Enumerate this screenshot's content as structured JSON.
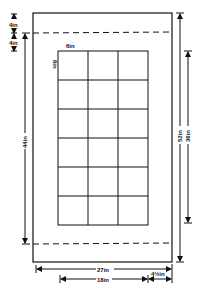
{
  "diagram": {
    "type": "dimensioned layout drawing",
    "outer_frame": {
      "width_label": "27in",
      "height_label": "52in"
    },
    "top_margin": {
      "label": "4in"
    },
    "inner_offset": {
      "label": "4in"
    },
    "dashed_zone": {
      "height_label": "44in"
    },
    "grid": {
      "columns": 3,
      "rows": 6,
      "cell_label_horizontal": "6in",
      "cell_label_vertical": "6in",
      "width_label": "18in",
      "height_label": "36in"
    },
    "side_margin": {
      "label": "4½in"
    },
    "colors": {
      "line": "#111111",
      "background": "#ffffff"
    }
  },
  "labels": {
    "top_4in_a": "4in",
    "top_4in_b": "4in",
    "left_44in": "44in",
    "right_52in": "52in",
    "right_36in": "36in",
    "cell_6in_h": "6in",
    "cell_6in_v": "6in",
    "bottom_27in": "27in",
    "bottom_18in": "18in",
    "bottom_4half": "4½in"
  }
}
